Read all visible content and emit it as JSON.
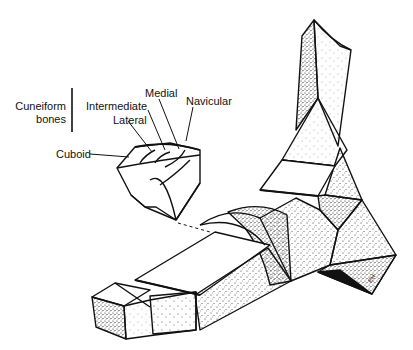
{
  "figure": {
    "labels": {
      "cuneiform_group_line1": "Cuneiform",
      "cuneiform_group_line2": "bones",
      "medial": "Medial",
      "intermediate": "Intermediate",
      "lateral": "Lateral",
      "navicular": "Navicular",
      "cuboid": "Cuboid"
    },
    "signature": "EH",
    "colors": {
      "line": "#111111",
      "background": "#ffffff",
      "stipple": "#333333"
    }
  }
}
